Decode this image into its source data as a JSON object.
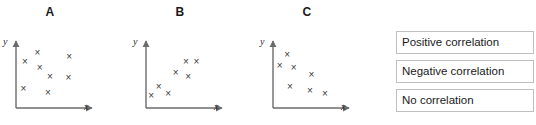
{
  "plots": [
    {
      "title": "A",
      "y_axis_label": "y",
      "x_axis_label": "x",
      "correlation": "none",
      "marker": "×",
      "left": 0,
      "chart_data": {
        "type": "scatter",
        "title": "A",
        "xlabel": "x",
        "ylabel": "y",
        "xlim": [
          0,
          10
        ],
        "ylim": [
          0,
          10
        ],
        "grid": false,
        "legend": "none",
        "series": [
          {
            "name": "A",
            "points": [
              [
                1.2,
                7.2
              ],
              [
                2.9,
                8.6
              ],
              [
                3.2,
                6.3
              ],
              [
                1.0,
                3.1
              ],
              [
                4.6,
                5.0
              ],
              [
                4.3,
                2.5
              ],
              [
                7.2,
                8.0
              ],
              [
                7.1,
                4.8
              ]
            ]
          }
        ]
      }
    },
    {
      "title": "B",
      "y_axis_label": "y",
      "x_axis_label": "x",
      "correlation": "positive",
      "marker": "×",
      "left": 130,
      "chart_data": {
        "type": "scatter",
        "title": "B",
        "xlabel": "x",
        "ylabel": "y",
        "xlim": [
          0,
          10
        ],
        "ylim": [
          0,
          10
        ],
        "grid": false,
        "legend": "none",
        "series": [
          {
            "name": "B",
            "points": [
              [
                0.7,
                2.0
              ],
              [
                1.7,
                3.4
              ],
              [
                3.0,
                2.3
              ],
              [
                4.0,
                5.6
              ],
              [
                5.4,
                7.2
              ],
              [
                6.8,
                7.2
              ],
              [
                5.7,
                4.9
              ]
            ]
          }
        ]
      }
    },
    {
      "title": "C",
      "y_axis_label": "y",
      "x_axis_label": "x",
      "correlation": "negative",
      "marker": "×",
      "left": 257,
      "chart_data": {
        "type": "scatter",
        "title": "C",
        "xlabel": "x",
        "ylabel": "y",
        "xlim": [
          0,
          10
        ],
        "ylim": [
          0,
          10
        ],
        "grid": false,
        "legend": "none",
        "series": [
          {
            "name": "C",
            "points": [
              [
                1.9,
                8.4
              ],
              [
                0.9,
                6.7
              ],
              [
                2.8,
                6.4
              ],
              [
                5.2,
                5.2
              ],
              [
                2.3,
                3.4
              ],
              [
                5.0,
                2.8
              ],
              [
                7.0,
                2.3
              ]
            ]
          }
        ]
      }
    }
  ],
  "legend": {
    "items": [
      {
        "label": "Positive correlation"
      },
      {
        "label": "Negative correlation"
      },
      {
        "label": "No correlation"
      }
    ]
  },
  "colors": {
    "axis": "#6b6b6b",
    "marker": "#3a3a3a",
    "box_border": "#bfbfbf",
    "text": "#1a1a1a",
    "background": "#ffffff"
  }
}
